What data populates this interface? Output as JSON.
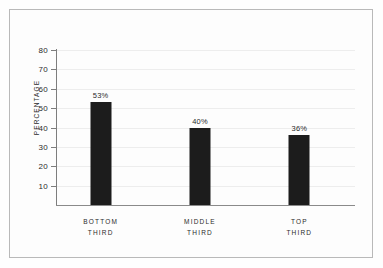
{
  "chart_data": {
    "type": "bar",
    "title": "",
    "subtitle": "",
    "xlabel": "",
    "ylabel": "PERCENTAGE",
    "categories": [
      "BOTTOM THIRD",
      "MIDDLE THIRD",
      "TOP THIRD"
    ],
    "category_lines": [
      [
        "BOTTOM",
        "THIRD"
      ],
      [
        "MIDDLE",
        "THIRD"
      ],
      [
        "TOP",
        "THIRD"
      ]
    ],
    "values": [
      53,
      40,
      36
    ],
    "value_labels": [
      "53%",
      "40%",
      "36%"
    ],
    "ylim": [
      0,
      80
    ],
    "ytick_values": [
      10,
      20,
      30,
      40,
      50,
      60,
      70,
      80
    ],
    "ytick_labels": [
      "10",
      "20",
      "30",
      "40",
      "50",
      "60",
      "70",
      "80"
    ],
    "grid": true,
    "grid_orientation": "horizontal",
    "legend": false,
    "legend_position": "none",
    "bar_color": "#1c1c1c",
    "grid_color": "#ededed",
    "axis_color": "#7d7d7d",
    "background_color": "#fdfdfd",
    "frame_color": "#b9b9b9",
    "text_color": "#2b2b2b"
  }
}
